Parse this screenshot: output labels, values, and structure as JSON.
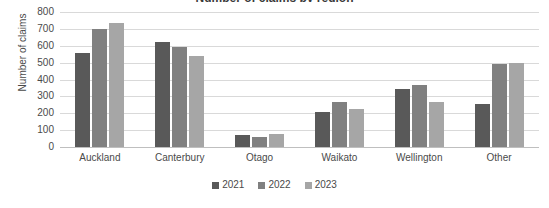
{
  "chart_data": {
    "type": "bar",
    "title": "Number of claims by region",
    "xlabel": "",
    "ylabel": "Number of claims",
    "ylim": [
      0,
      800
    ],
    "ytick_step": 100,
    "yticks": [
      800,
      700,
      600,
      500,
      400,
      300,
      200,
      100,
      0
    ],
    "grid": true,
    "legend_position": "bottom",
    "categories": [
      "Auckland",
      "Canterbury",
      "Otago",
      "Waikato",
      "Wellington",
      "Other"
    ],
    "series": [
      {
        "name": "2021",
        "color": "#595959",
        "values": [
          560,
          622,
          72,
          210,
          345,
          255
        ]
      },
      {
        "name": "2022",
        "color": "#808080",
        "values": [
          700,
          595,
          57,
          265,
          365,
          490
        ]
      },
      {
        "name": "2023",
        "color": "#a6a6a6",
        "values": [
          735,
          540,
          75,
          225,
          265,
          500
        ]
      }
    ]
  },
  "colors": {
    "gridline": "#d9d9d9",
    "axis": "#bfbfbf",
    "text": "#4a4a4a",
    "background": "#ffffff"
  }
}
